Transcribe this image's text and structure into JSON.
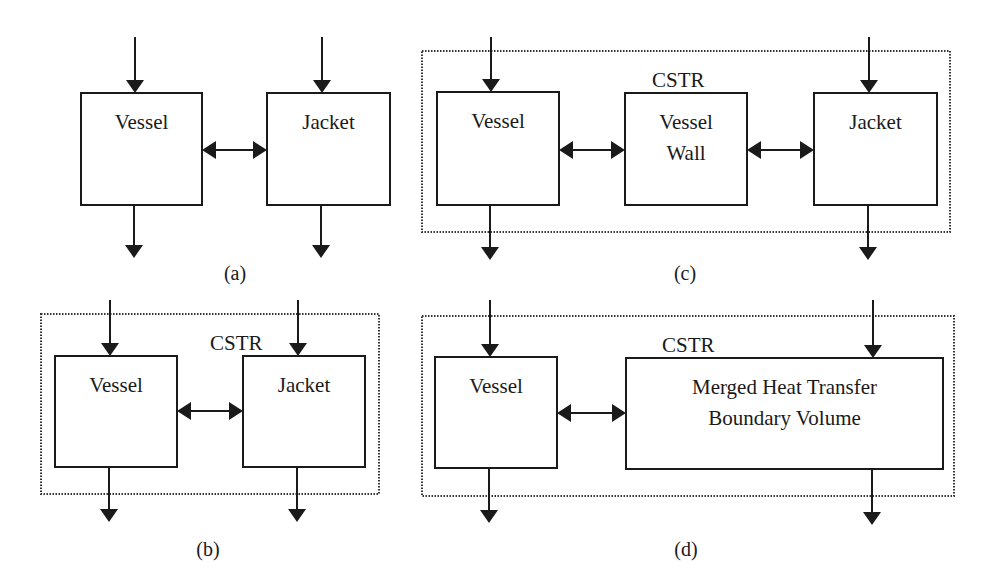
{
  "colors": {
    "ink": "#1a1a1a",
    "boundary": "#333333",
    "background": "#ffffff"
  },
  "panels": [
    {
      "id": "a",
      "caption": "(a)",
      "caption_pos": [
        235,
        280
      ],
      "boundary": null,
      "boundary_label": null,
      "boxes": [
        {
          "name": "vessel",
          "lines": [
            "Vessel"
          ],
          "x": 81,
          "y": 93,
          "w": 121,
          "h": 112
        },
        {
          "name": "jacket",
          "lines": [
            "Jacket"
          ],
          "x": 267,
          "y": 93,
          "w": 123,
          "h": 112
        }
      ],
      "flows": [
        {
          "name": "vessel-inlet",
          "x": 135,
          "y1": 37,
          "y2": 93
        },
        {
          "name": "vessel-outlet",
          "x": 134,
          "y1": 205,
          "y2": 258
        },
        {
          "name": "jacket-inlet",
          "x": 322,
          "y1": 37,
          "y2": 93
        },
        {
          "name": "jacket-outlet",
          "x": 321,
          "y1": 205,
          "y2": 258
        }
      ],
      "exchanges": [
        {
          "name": "vessel-jacket-exchange",
          "x1": 202,
          "x2": 267,
          "y": 150
        }
      ]
    },
    {
      "id": "b",
      "caption": "(b)",
      "caption_pos": [
        208,
        556
      ],
      "boundary": {
        "x": 41,
        "y": 314,
        "w": 338,
        "h": 180
      },
      "boundary_label": {
        "text": "CSTR",
        "x": 210,
        "y": 350
      },
      "boxes": [
        {
          "name": "vessel",
          "lines": [
            "Vessel"
          ],
          "x": 55,
          "y": 356,
          "w": 122,
          "h": 111
        },
        {
          "name": "jacket",
          "lines": [
            "Jacket"
          ],
          "x": 243,
          "y": 356,
          "w": 122,
          "h": 111
        }
      ],
      "flows": [
        {
          "name": "vessel-inlet",
          "x": 110,
          "y1": 300,
          "y2": 356
        },
        {
          "name": "vessel-outlet",
          "x": 109,
          "y1": 467,
          "y2": 522
        },
        {
          "name": "jacket-inlet",
          "x": 298,
          "y1": 300,
          "y2": 356
        },
        {
          "name": "jacket-outlet",
          "x": 297,
          "y1": 467,
          "y2": 522
        }
      ],
      "exchanges": [
        {
          "name": "vessel-jacket-exchange",
          "x1": 177,
          "x2": 243,
          "y": 411
        }
      ]
    },
    {
      "id": "c",
      "caption": "(c)",
      "caption_pos": [
        685,
        280
      ],
      "boundary": {
        "x": 422,
        "y": 51,
        "w": 528,
        "h": 181
      },
      "boundary_label": {
        "text": "CSTR",
        "x": 652,
        "y": 87
      },
      "boxes": [
        {
          "name": "vessel",
          "lines": [
            "Vessel"
          ],
          "x": 437,
          "y": 92,
          "w": 122,
          "h": 113
        },
        {
          "name": "vessel-wall",
          "lines": [
            "Vessel",
            "Wall"
          ],
          "x": 625,
          "y": 93,
          "w": 122,
          "h": 112
        },
        {
          "name": "jacket",
          "lines": [
            "Jacket"
          ],
          "x": 814,
          "y": 93,
          "w": 123,
          "h": 112
        }
      ],
      "flows": [
        {
          "name": "vessel-inlet",
          "x": 491,
          "y1": 37,
          "y2": 92
        },
        {
          "name": "vessel-outlet",
          "x": 490,
          "y1": 205,
          "y2": 260
        },
        {
          "name": "jacket-inlet",
          "x": 869,
          "y1": 37,
          "y2": 93
        },
        {
          "name": "jacket-outlet",
          "x": 868,
          "y1": 205,
          "y2": 260
        }
      ],
      "exchanges": [
        {
          "name": "vessel-wall-exchange",
          "x1": 559,
          "x2": 625,
          "y": 150
        },
        {
          "name": "wall-jacket-exchange",
          "x1": 747,
          "x2": 814,
          "y": 150
        }
      ]
    },
    {
      "id": "d",
      "caption": "(d)",
      "caption_pos": [
        686,
        556
      ],
      "boundary": {
        "x": 422,
        "y": 316,
        "w": 532,
        "h": 180
      },
      "boundary_label": {
        "text": "CSTR",
        "x": 662,
        "y": 352
      },
      "boxes": [
        {
          "name": "vessel",
          "lines": [
            "Vessel"
          ],
          "x": 435,
          "y": 357,
          "w": 122,
          "h": 111
        },
        {
          "name": "merged-volume",
          "lines": [
            "Merged Heat Transfer",
            "Boundary Volume"
          ],
          "x": 626,
          "y": 358,
          "w": 317,
          "h": 111
        }
      ],
      "flows": [
        {
          "name": "vessel-inlet",
          "x": 490,
          "y1": 300,
          "y2": 357
        },
        {
          "name": "vessel-outlet",
          "x": 489,
          "y1": 468,
          "y2": 523
        },
        {
          "name": "jacket-inlet",
          "x": 873,
          "y1": 300,
          "y2": 358
        },
        {
          "name": "jacket-outlet",
          "x": 872,
          "y1": 469,
          "y2": 525
        }
      ],
      "exchanges": [
        {
          "name": "vessel-merged-exchange",
          "x1": 557,
          "x2": 626,
          "y": 413
        }
      ]
    }
  ]
}
